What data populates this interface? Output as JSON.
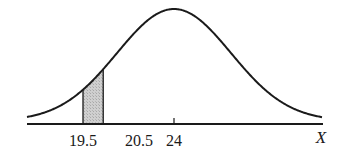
{
  "chart_data": {
    "type": "area",
    "title": "",
    "xlabel": "X",
    "ylabel": "",
    "mean": 24,
    "tick_labels": [
      "19.5",
      "20.5",
      "24"
    ],
    "ticks": [
      19.5,
      20.5,
      24
    ],
    "shaded_region": {
      "from": 19.5,
      "to": 20.5
    },
    "grid": false,
    "legend": null,
    "colors": {
      "curve": "#1a1a1a",
      "shade": "#c9c9c9",
      "axis": "#1a1a1a"
    }
  }
}
